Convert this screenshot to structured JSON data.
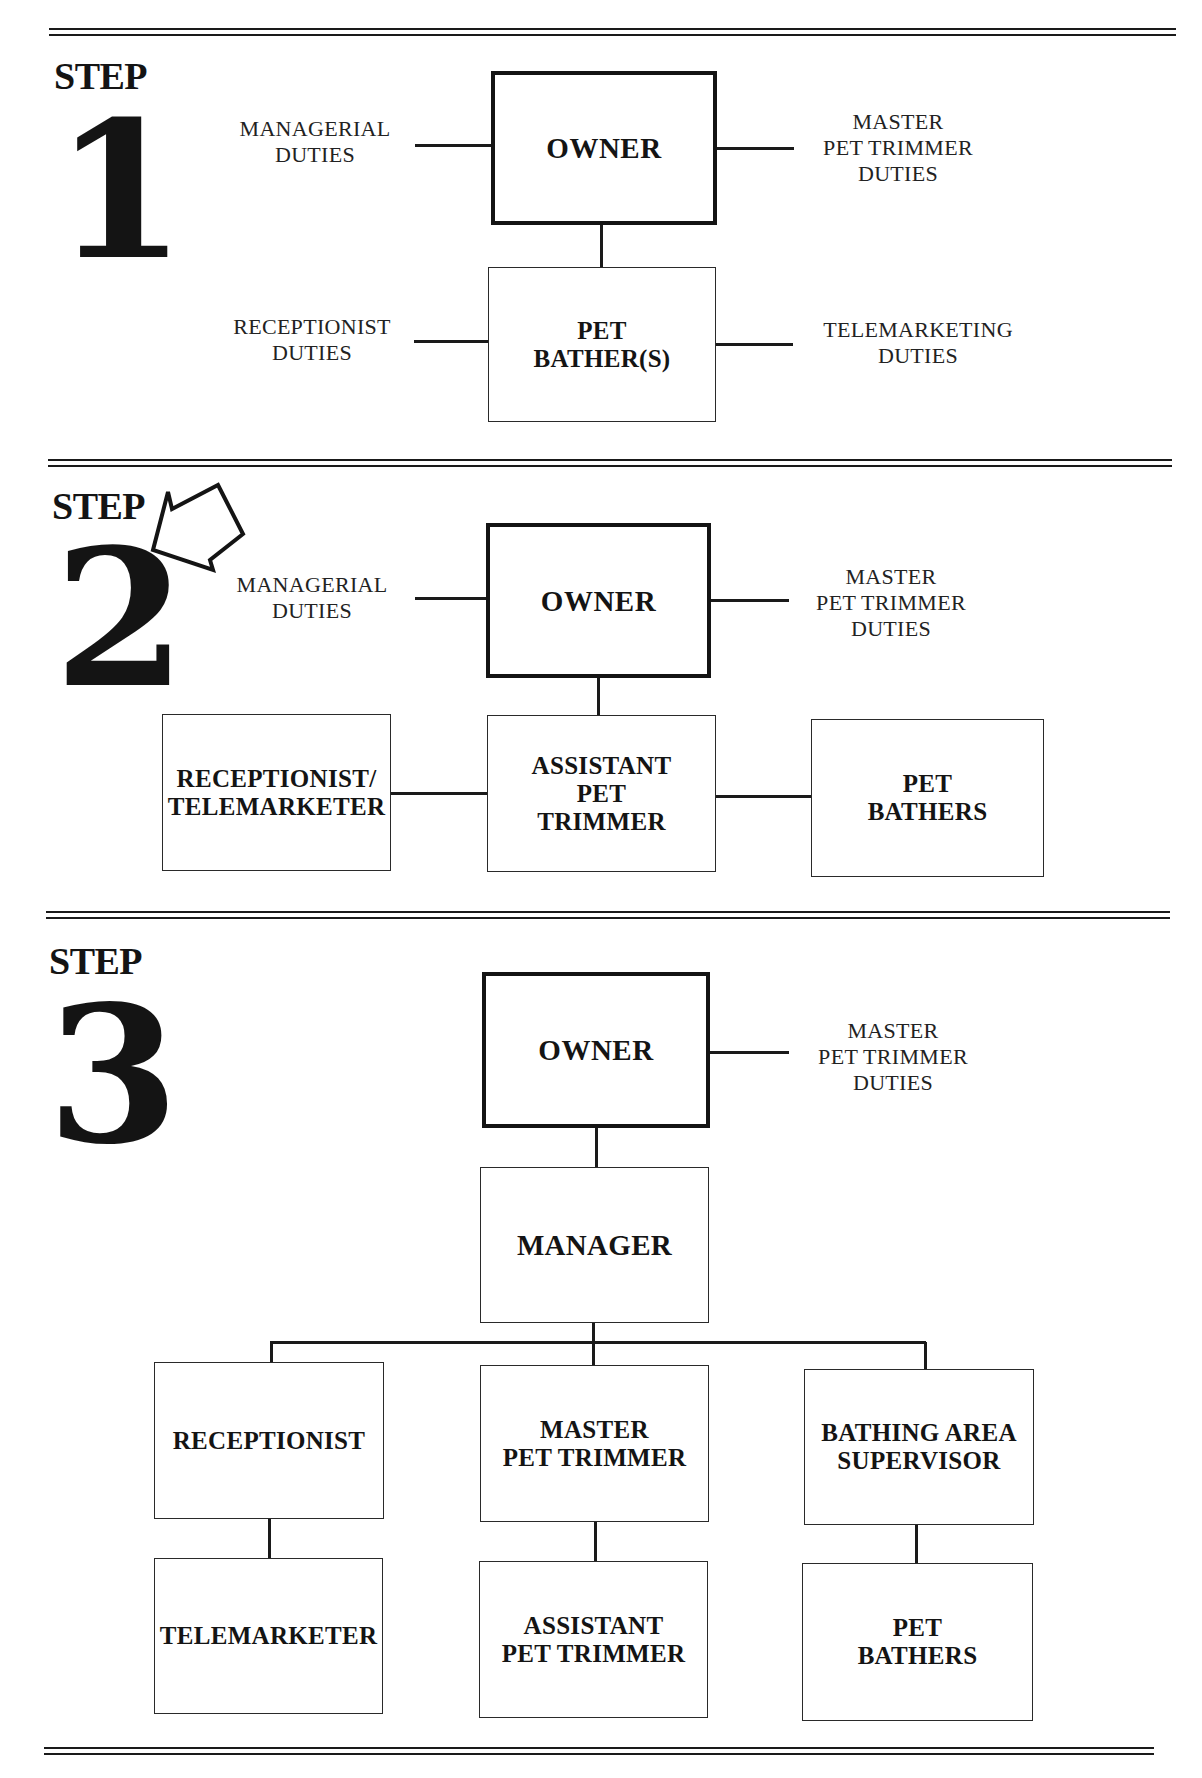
{
  "steps": [
    {
      "label": "STEP",
      "number": "1",
      "owner": "OWNER",
      "duties_left_top": "MANAGERIAL\nDUTIES",
      "duties_right_top": "MASTER\nPET TRIMMER\nDUTIES",
      "child_box": "PET\nBATHER(S)",
      "duties_left_bottom": "RECEPTIONIST\nDUTIES",
      "duties_right_bottom": "TELEMARKETING\nDUTIES"
    },
    {
      "label": "STEP",
      "number": "2",
      "arrow_icon": "arrow-pointing-down-left",
      "owner": "OWNER",
      "duties_left_top": "MANAGERIAL\nDUTIES",
      "duties_right_top": "MASTER\nPET TRIMMER\nDUTIES",
      "left_box": "RECEPTIONIST/\nTELEMARKETER",
      "center_box": "ASSISTANT\nPET\nTRIMMER",
      "right_box": "PET\nBATHERS"
    },
    {
      "label": "STEP",
      "number": "3",
      "owner": "OWNER",
      "duties_right_top": "MASTER\nPET TRIMMER\nDUTIES",
      "manager_box": "MANAGER",
      "row1": [
        "RECEPTIONIST",
        "MASTER\nPET TRIMMER",
        "BATHING AREA\nSUPERVISOR"
      ],
      "row2": [
        "TELEMARKETER",
        "ASSISTANT\nPET TRIMMER",
        "PET\nBATHERS"
      ]
    }
  ],
  "colors": {
    "ink": "#141414",
    "background": "#ffffff"
  }
}
